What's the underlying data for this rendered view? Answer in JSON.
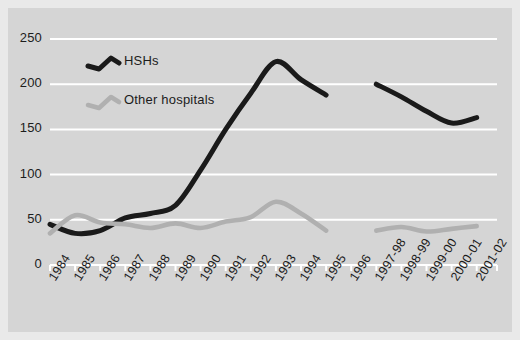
{
  "chart_data": {
    "type": "line",
    "title": "",
    "subtitle": "",
    "xlabel": "",
    "ylabel": "",
    "ylim": [
      0,
      250
    ],
    "yticks": [
      0,
      50,
      100,
      150,
      200,
      250
    ],
    "ytick_labels": [
      "0",
      "50",
      "100",
      "150",
      "200",
      "250"
    ],
    "grid": true,
    "legend_position": "upper-left",
    "categories": [
      "1984",
      "1985",
      "1986",
      "1987",
      "1988",
      "1989",
      "1990",
      "1991",
      "1992",
      "1993",
      "1994",
      "1995",
      "1996",
      "1997-98",
      "1998-99",
      "1999-00",
      "2000-01",
      "2001-02"
    ],
    "series": [
      {
        "name": "HSHs",
        "color": "#1a1a1a",
        "values": [
          45,
          35,
          38,
          52,
          57,
          66,
          105,
          150,
          190,
          225,
          205,
          188,
          null,
          200,
          186,
          170,
          157,
          163
        ]
      },
      {
        "name": "Other hospitals",
        "color": "#b0b0b0",
        "values": [
          35,
          55,
          47,
          45,
          41,
          46,
          41,
          48,
          53,
          70,
          57,
          38,
          null,
          38,
          42,
          37,
          40,
          43
        ]
      }
    ],
    "annotations": []
  },
  "legend": {
    "items": [
      {
        "label": "HSHs",
        "marker": "zigzag-line-dark"
      },
      {
        "label": "Other hospitals",
        "marker": "zigzag-line-light"
      }
    ]
  },
  "axes": {
    "y": {
      "tick_labels": [
        "250",
        "200",
        "150",
        "100",
        "50",
        "0"
      ]
    },
    "x": {
      "tick_labels": [
        "1984",
        "1985",
        "1986",
        "1987",
        "1988",
        "1989",
        "1990",
        "1991",
        "1992",
        "1993",
        "1994",
        "1995",
        "1996",
        "1997-98",
        "1998-99",
        "1999-00",
        "2000-01",
        "2001-02"
      ]
    }
  },
  "colors": {
    "background": "#d5d5d5",
    "page": "#e9e9e9",
    "gridline": "#ffffff",
    "axis": "#ffffff",
    "series_dark": "#1a1a1a",
    "series_light": "#b0b0b0",
    "text": "#1c1c1c"
  }
}
